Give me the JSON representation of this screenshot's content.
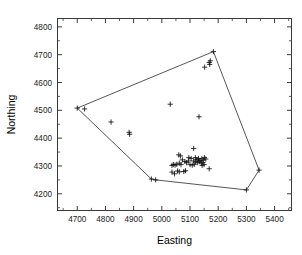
{
  "chart_data": {
    "type": "scatter",
    "title": "",
    "xlabel": "Easting",
    "ylabel": "Northing",
    "xlim": [
      4630,
      5460
    ],
    "ylim": [
      4140,
      4830
    ],
    "xticks": [
      4700,
      4800,
      4900,
      5000,
      5100,
      5200,
      5300,
      5400
    ],
    "yticks": [
      4200,
      4300,
      4400,
      4500,
      4600,
      4700,
      4800
    ],
    "xticklabels": [
      "4700",
      "4800",
      "4900",
      "5000",
      "5100",
      "5200",
      "5300",
      "5400"
    ],
    "yticklabels": [
      "4200",
      "4300",
      "4400",
      "4500",
      "4600",
      "4700",
      "4800"
    ],
    "minor_ticks": true,
    "grid": false,
    "legend": null,
    "marker": "plus",
    "marker_color": "#111111",
    "hull_color": "#2b2b2b",
    "frame_color": "#3a3a3a",
    "series": [
      {
        "name": "sample locations",
        "points": [
          [
            4700,
            4508
          ],
          [
            4726,
            4505
          ],
          [
            4820,
            4458
          ],
          [
            4884,
            4421
          ],
          [
            4886,
            4414
          ],
          [
            5030,
            4522
          ],
          [
            5132,
            4477
          ],
          [
            5183,
            4711
          ],
          [
            5168,
            4672
          ],
          [
            5172,
            4678
          ],
          [
            5170,
            4665
          ],
          [
            5152,
            4655
          ],
          [
            5113,
            4363
          ],
          [
            5060,
            4340
          ],
          [
            5066,
            4336
          ],
          [
            5096,
            4330
          ],
          [
            5104,
            4327
          ],
          [
            5119,
            4330
          ],
          [
            5124,
            4323
          ],
          [
            5130,
            4327
          ],
          [
            5136,
            4320
          ],
          [
            5142,
            4326
          ],
          [
            5147,
            4321
          ],
          [
            5151,
            4330
          ],
          [
            5156,
            4325
          ],
          [
            5113,
            4318
          ],
          [
            5120,
            4315
          ],
          [
            5127,
            4312
          ],
          [
            5133,
            4316
          ],
          [
            5140,
            4310
          ],
          [
            5146,
            4313
          ],
          [
            5082,
            4316
          ],
          [
            5088,
            4312
          ],
          [
            5094,
            4318
          ],
          [
            5073,
            4322
          ],
          [
            5041,
            4305
          ],
          [
            5047,
            4303
          ],
          [
            5053,
            4306
          ],
          [
            5036,
            4302
          ],
          [
            5062,
            4310
          ],
          [
            5068,
            4305
          ],
          [
            5100,
            4305
          ],
          [
            5108,
            4303
          ],
          [
            5115,
            4306
          ],
          [
            5143,
            4302
          ],
          [
            5150,
            4305
          ],
          [
            5168,
            4290
          ],
          [
            5045,
            4272
          ],
          [
            5056,
            4282
          ],
          [
            5062,
            4279
          ],
          [
            5078,
            4280
          ],
          [
            5084,
            4283
          ],
          [
            5036,
            4278
          ],
          [
            4963,
            4253
          ],
          [
            4978,
            4250
          ],
          [
            5300,
            4214
          ],
          [
            5345,
            4285
          ]
        ]
      }
    ],
    "hull": [
      [
        4700,
        4508
      ],
      [
        5183,
        4711
      ],
      [
        5345,
        4285
      ],
      [
        5300,
        4214
      ],
      [
        4978,
        4250
      ],
      [
        4963,
        4253
      ]
    ]
  }
}
